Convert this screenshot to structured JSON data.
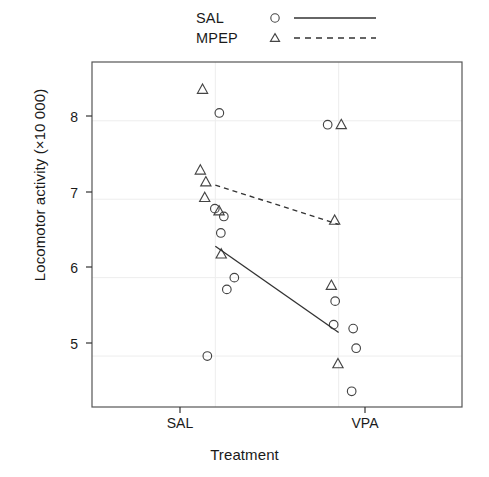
{
  "chart_data": {
    "type": "scatter",
    "title": "",
    "xlabel": "Treatment",
    "ylabel": "Locomotor activity (×10 000)",
    "categories": [
      "SAL",
      "VPA"
    ],
    "xtick_labels": [
      "SAL",
      "VPA"
    ],
    "ytick_labels": [
      "5",
      "6",
      "7",
      "8"
    ],
    "yticks": [
      5,
      6,
      7,
      8
    ],
    "ylim": [
      4.35,
      8.75
    ],
    "xlim": [
      0.5,
      2.5
    ],
    "grid": true,
    "legend_position": "top",
    "legend": [
      {
        "label": "SAL",
        "marker": "circle",
        "line": "solid"
      },
      {
        "label": "MPEP",
        "marker": "triangle",
        "line": "dashed"
      }
    ],
    "series": [
      {
        "name": "SAL",
        "marker": "circle",
        "line": "solid",
        "points": [
          {
            "x": "SAL",
            "y": 8.1
          },
          {
            "x": "SAL",
            "y": 6.88
          },
          {
            "x": "SAL",
            "y": 6.78
          },
          {
            "x": "SAL",
            "y": 6.57
          },
          {
            "x": "SAL",
            "y": 6.0
          },
          {
            "x": "SAL",
            "y": 5.85
          },
          {
            "x": "SAL",
            "y": 5.0
          },
          {
            "x": "VPA",
            "y": 7.95
          },
          {
            "x": "VPA",
            "y": 5.7
          },
          {
            "x": "VPA",
            "y": 5.4
          },
          {
            "x": "VPA",
            "y": 5.35
          },
          {
            "x": "VPA",
            "y": 5.1
          },
          {
            "x": "VPA",
            "y": 4.55
          }
        ],
        "fit_line": {
          "x1": "SAL",
          "y1": 6.4,
          "x2": "VPA",
          "y2": 5.3
        }
      },
      {
        "name": "MPEP",
        "marker": "triangle",
        "line": "dashed",
        "points": [
          {
            "x": "SAL",
            "y": 8.4
          },
          {
            "x": "SAL",
            "y": 7.37
          },
          {
            "x": "SAL",
            "y": 7.22
          },
          {
            "x": "SAL",
            "y": 7.02
          },
          {
            "x": "SAL",
            "y": 6.85
          },
          {
            "x": "SAL",
            "y": 6.3
          },
          {
            "x": "VPA",
            "y": 7.95
          },
          {
            "x": "VPA",
            "y": 6.73
          },
          {
            "x": "VPA",
            "y": 5.9
          },
          {
            "x": "VPA",
            "y": 4.9
          }
        ],
        "fit_line": {
          "x1": "SAL",
          "y1": 7.18,
          "x2": "VPA",
          "y2": 6.68
        }
      }
    ],
    "colors": {
      "marker": "#444444",
      "line": "#333333",
      "panel_border": "#555555",
      "grid": "#eaeaea",
      "background": "#ffffff"
    }
  }
}
